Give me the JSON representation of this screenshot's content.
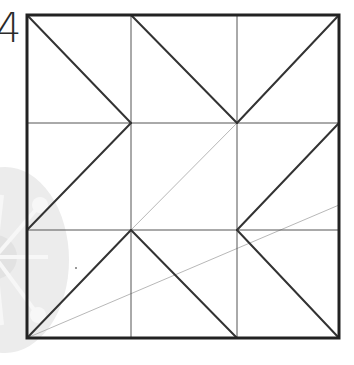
{
  "figure": {
    "label": "4",
    "type": "square grid diagram with diagonals",
    "grid": {
      "columns": 3,
      "rows": 3,
      "x_lines": [
        27,
        131,
        237,
        339
      ],
      "y_lines": [
        15,
        123,
        230,
        338
      ]
    },
    "colors": {
      "outline": "#222222",
      "grid_line": "#555555",
      "bold_diagonal": "#333333",
      "faint_line": "#b8b8b8",
      "watermark": "#e9e9e9"
    },
    "bold_diagonals": [
      {
        "x1": 27,
        "y1": 15,
        "x2": 131,
        "y2": 123
      },
      {
        "x1": 131,
        "y1": 123,
        "x2": 27,
        "y2": 230
      },
      {
        "x1": 131,
        "y1": 15,
        "x2": 237,
        "y2": 123
      },
      {
        "x1": 237,
        "y1": 123,
        "x2": 339,
        "y2": 15
      },
      {
        "x1": 339,
        "y1": 123,
        "x2": 237,
        "y2": 230
      },
      {
        "x1": 27,
        "y1": 338,
        "x2": 131,
        "y2": 230
      },
      {
        "x1": 131,
        "y1": 230,
        "x2": 237,
        "y2": 338
      },
      {
        "x1": 237,
        "y1": 230,
        "x2": 339,
        "y2": 338
      }
    ],
    "faint_lines": [
      {
        "x1": 131,
        "y1": 230,
        "x2": 237,
        "y2": 123
      },
      {
        "x1": 27,
        "y1": 338,
        "x2": 339,
        "y2": 205
      }
    ],
    "dot": {
      "cx": 76,
      "cy": 268
    }
  }
}
